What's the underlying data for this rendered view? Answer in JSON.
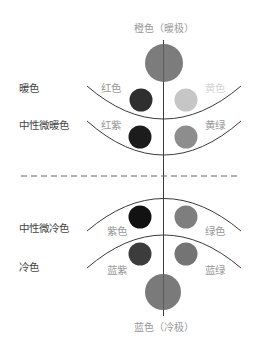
{
  "poles": {
    "top": {
      "label": "橙色（暖极）",
      "color": "#7c7c7c"
    },
    "bottom": {
      "label": "蓝色（冷极）",
      "color": "#7a7a7a"
    }
  },
  "groups": [
    {
      "label": "暖色",
      "left": {
        "label": "红色",
        "color": "#2f2f2f"
      },
      "right": {
        "label": "黄色",
        "color": "#c6c6c6"
      }
    },
    {
      "label": "中性微暖色",
      "left": {
        "label": "红紫",
        "color": "#1c1c1c"
      },
      "right": {
        "label": "黄绿",
        "color": "#8d8d8d"
      }
    },
    {
      "label": "中性微冷色",
      "left": {
        "label": "紫色",
        "color": "#121212"
      },
      "right": {
        "label": "绿色",
        "color": "#7e7e7e"
      }
    },
    {
      "label": "冷色",
      "left": {
        "label": "蓝紫",
        "color": "#3c3c3c"
      },
      "right": {
        "label": "蓝绿",
        "color": "#747474"
      }
    }
  ],
  "colors": {
    "line": "#3a3a3a",
    "dash": "#666666"
  }
}
